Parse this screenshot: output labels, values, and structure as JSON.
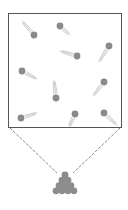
{
  "diagram": {
    "colors": {
      "background": "#ffffff",
      "box_stroke": "#555555",
      "particle_fill": "#8a8a8a",
      "trail_stroke": "#a8a8a8",
      "dash_stroke": "#666666",
      "pile_fill": "#8c8c8c"
    },
    "container": {
      "x": 8.5,
      "y": 13.5,
      "width": 113,
      "height": 114
    },
    "particles": [
      {
        "cx": 34,
        "cy": 35,
        "tx": 22,
        "ty": 21
      },
      {
        "cx": 60,
        "cy": 26,
        "tx": 70,
        "ty": 35
      },
      {
        "cx": 77,
        "cy": 56,
        "tx": 60,
        "ty": 51
      },
      {
        "cx": 109,
        "cy": 46,
        "tx": 99,
        "ty": 62
      },
      {
        "cx": 22,
        "cy": 71,
        "tx": 37,
        "ty": 79
      },
      {
        "cx": 56,
        "cy": 98,
        "tx": 54,
        "ty": 80
      },
      {
        "cx": 104,
        "cy": 82,
        "tx": 93,
        "ty": 96
      },
      {
        "cx": 21,
        "cy": 118,
        "tx": 37,
        "ty": 113
      },
      {
        "cx": 75,
        "cy": 114,
        "tx": 69,
        "ty": 127
      },
      {
        "cx": 104,
        "cy": 113,
        "tx": 117,
        "ty": 125
      }
    ],
    "particle_radius": 3.4,
    "funnel": {
      "left": {
        "x1": 10,
        "y1": 128,
        "x2": 57,
        "y2": 173
      },
      "right": {
        "x1": 120,
        "y1": 128,
        "x2": 73,
        "y2": 173
      }
    },
    "pile": {
      "apex_x": 65,
      "apex_y": 175,
      "rows": 4,
      "radius": 3.4
    }
  }
}
